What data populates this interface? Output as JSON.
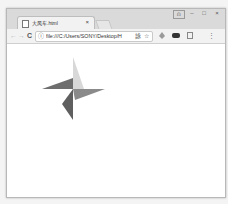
{
  "browser": {
    "tab": {
      "title": "大风车.html",
      "close_label": "×"
    },
    "window_controls": {
      "profile": "⍝",
      "minimize": "–",
      "maximize": "□",
      "close": "×"
    },
    "toolbar": {
      "back": "←",
      "forward": "→",
      "reload": "C",
      "info_icon": "ⓘ",
      "url": "file:///C:/Users/SONY/Desktop/H",
      "translate_icon": "詠",
      "bookmark_icon": "☆",
      "menu_icon": "⋮"
    }
  },
  "page": {
    "pinwheel": {
      "center": [
        73,
        89
      ],
      "blades": [
        {
          "name": "top",
          "color": "#d8d8d8"
        },
        {
          "name": "left",
          "color": "#6e6e6e"
        },
        {
          "name": "right",
          "color": "#8a8a8a"
        },
        {
          "name": "bottom",
          "color": "#5f5f5f"
        }
      ]
    }
  }
}
